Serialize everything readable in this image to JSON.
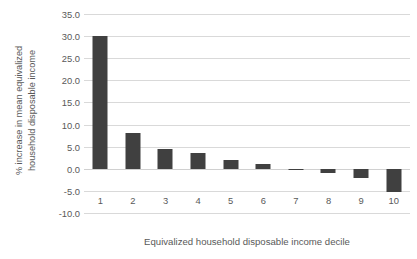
{
  "chart_data": {
    "type": "bar",
    "title": "",
    "xlabel": "Equivalized household disposable income decile",
    "ylabel": "% increase in mean equivalized household disposable income",
    "ylabel_lines": [
      "% increase in mean equivalized",
      "household disposable income"
    ],
    "categories": [
      "1",
      "2",
      "3",
      "4",
      "5",
      "6",
      "7",
      "8",
      "9",
      "10"
    ],
    "values": [
      30.0,
      8.0,
      4.4,
      3.5,
      2.0,
      1.0,
      -0.3,
      -1.0,
      -2.0,
      -5.2
    ],
    "series": [
      {
        "name": "% increase in mean equivalized household disposable income",
        "values": [
          30.0,
          8.0,
          4.4,
          3.5,
          2.0,
          1.0,
          -0.3,
          -1.0,
          -2.0,
          -5.2
        ]
      }
    ],
    "ylim": [
      -10.0,
      35.0
    ],
    "ytick_step": 5.0,
    "ytick_labels": [
      "35.0",
      "30.0",
      "25.0",
      "20.0",
      "15.0",
      "10.0",
      "5.0",
      "0.0",
      "-5.0",
      "-10.0"
    ],
    "ytick_values": [
      35.0,
      30.0,
      25.0,
      20.0,
      15.0,
      10.0,
      5.0,
      0.0,
      -5.0,
      -10.0
    ],
    "grid": true,
    "legend": false,
    "legend_position": "none",
    "bar_color": "#404040",
    "gridline_color": "#d9d9d9",
    "text_color": "#595959",
    "background_color": "#ffffff"
  }
}
